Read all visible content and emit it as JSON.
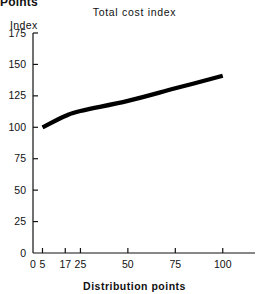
{
  "page": {
    "cut_off_header": "Points"
  },
  "chart_data": {
    "type": "line",
    "title": "Total cost index",
    "xlabel": "Distribution points",
    "ylabel": "Index",
    "x": [
      5,
      17,
      25,
      50,
      75,
      100
    ],
    "values": [
      100,
      109,
      113,
      121,
      131,
      141
    ],
    "series": [
      {
        "name": "Total cost index",
        "values": [
          100,
          109,
          113,
          121,
          131,
          141
        ],
        "color": "#000000"
      }
    ],
    "xlim": [
      0,
      117
    ],
    "ylim": [
      0,
      175
    ],
    "xticks": [
      0,
      5,
      17,
      25,
      50,
      75,
      100
    ],
    "xtick_labels": [
      "0",
      "5",
      "17",
      "25",
      "50",
      "75",
      "100"
    ],
    "yticks": [
      0,
      25,
      50,
      75,
      100,
      125,
      150,
      175
    ],
    "ytick_labels": [
      "0",
      "25",
      "50",
      "75",
      "100",
      "125",
      "150",
      "175"
    ],
    "grid": false,
    "legend": "none",
    "line_color": "#000000",
    "axis_color": "#111111",
    "background": "#ffffff",
    "annotations": []
  }
}
